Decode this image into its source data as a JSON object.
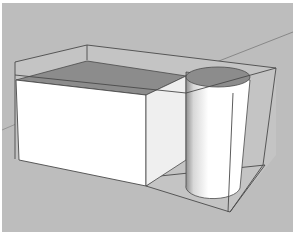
{
  "scene": {
    "type": "3d-viewport",
    "description": "Rectangular box and cylinder enclosed in a wireframe bounding box",
    "colors": {
      "background": "#bdbdbd",
      "ground_shadow": "#b4b4b4",
      "box_front": "#ffffff",
      "box_side": "#f2f2f2",
      "top_face": "#8c8c8c",
      "edge": "#4a4a4a",
      "axis_line": "#7a7a7a"
    },
    "objects": [
      {
        "name": "box",
        "label": ""
      },
      {
        "name": "cylinder",
        "label": ""
      },
      {
        "name": "bounding-box",
        "label": ""
      }
    ]
  }
}
